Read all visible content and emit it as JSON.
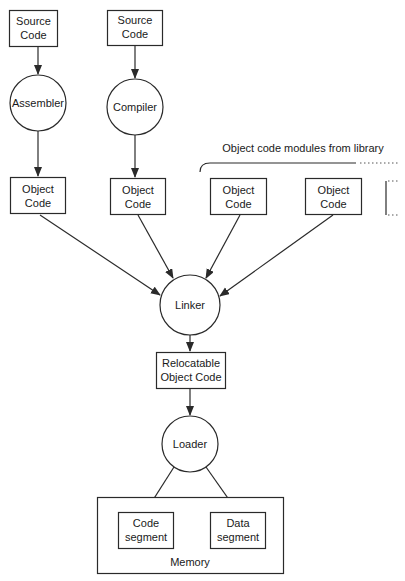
{
  "diagram": {
    "nodes": {
      "source1": {
        "lines": [
          "Source",
          "Code"
        ],
        "shape": "box"
      },
      "source2": {
        "lines": [
          "Source",
          "Code"
        ],
        "shape": "box"
      },
      "assembler": {
        "label": "Assembler",
        "shape": "circle"
      },
      "compiler": {
        "label": "Compiler",
        "shape": "circle"
      },
      "obj1": {
        "lines": [
          "Object",
          "Code"
        ],
        "shape": "box"
      },
      "obj2": {
        "lines": [
          "Object",
          "Code"
        ],
        "shape": "box"
      },
      "obj3": {
        "lines": [
          "Object",
          "Code"
        ],
        "shape": "box"
      },
      "obj4": {
        "lines": [
          "Object",
          "Code"
        ],
        "shape": "box"
      },
      "linker": {
        "label": "Linker",
        "shape": "circle"
      },
      "relocatable": {
        "lines": [
          "Relocatable",
          "Object Code"
        ],
        "shape": "box"
      },
      "loader": {
        "label": "Loader",
        "shape": "circle"
      },
      "code_segment": {
        "lines": [
          "Code",
          "segment"
        ],
        "shape": "box"
      },
      "data_segment": {
        "lines": [
          "Data",
          "segment"
        ],
        "shape": "box"
      },
      "memory": {
        "label": "Memory",
        "shape": "container"
      }
    },
    "library_label": "Object code modules from library",
    "edges": [
      {
        "from": "source1",
        "to": "assembler"
      },
      {
        "from": "source2",
        "to": "compiler"
      },
      {
        "from": "assembler",
        "to": "obj1"
      },
      {
        "from": "compiler",
        "to": "obj2"
      },
      {
        "from": "obj1",
        "to": "linker"
      },
      {
        "from": "obj2",
        "to": "linker"
      },
      {
        "from": "obj3",
        "to": "linker"
      },
      {
        "from": "obj4",
        "to": "linker"
      },
      {
        "from": "linker",
        "to": "relocatable"
      },
      {
        "from": "relocatable",
        "to": "loader"
      },
      {
        "from": "loader",
        "to": "code_segment"
      },
      {
        "from": "loader",
        "to": "data_segment"
      }
    ]
  }
}
